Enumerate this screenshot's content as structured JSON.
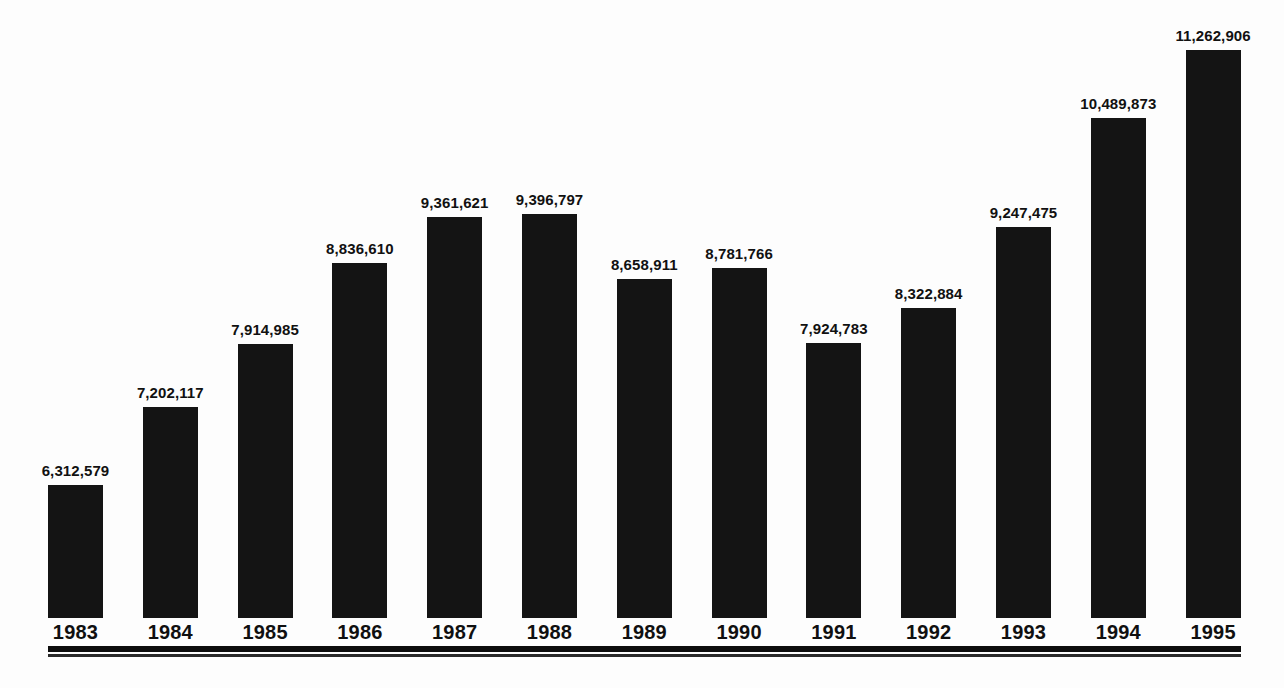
{
  "chart_data": {
    "type": "bar",
    "title": "",
    "subtitle": "",
    "xlabel": "",
    "ylabel": "",
    "grid": false,
    "legend": "none",
    "axis_baseline_value": 4800000,
    "ylim": [
      4800000,
      11600000
    ],
    "categories": [
      "1983",
      "1984",
      "1985",
      "1986",
      "1987",
      "1988",
      "1989",
      "1990",
      "1991",
      "1992",
      "1993",
      "1994",
      "1995"
    ],
    "values": [
      6312579,
      7202117,
      7914985,
      8836610,
      9361621,
      9396797,
      8658911,
      8781766,
      7924783,
      8322884,
      9247475,
      10489873,
      11262906
    ],
    "value_labels": [
      "6,312,579",
      "7,202,117",
      "7,914,985",
      "8,836,610",
      "9,361,621",
      "9,396,797",
      "8,658,911",
      "8,781,766",
      "7,924,783",
      "8,322,884",
      "9,247,475",
      "10,489,873",
      "11,262,906"
    ],
    "bar_color": "#141414",
    "label_color": "#111111",
    "background_color": "#fdfdfd"
  },
  "axis": {
    "baseline_color": "#0d0d0d"
  }
}
